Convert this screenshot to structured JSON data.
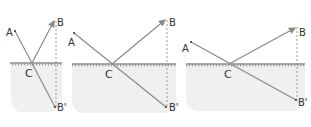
{
  "diagram": {
    "colors": {
      "ray": "#8a8a8a",
      "dashed": "#9a9a9a",
      "surface": "#555555",
      "water": "#f0f0f0",
      "label": "#333333"
    },
    "panels": [
      {
        "id": 1,
        "labels": {
          "A": "A",
          "B": "B",
          "C": "C",
          "Bp": "B'"
        }
      },
      {
        "id": 2,
        "labels": {
          "A": "A",
          "B": "B",
          "C": "C",
          "Bp": "B'"
        }
      },
      {
        "id": 3,
        "labels": {
          "A": "A",
          "B": "B",
          "C": "C",
          "Bp": "B'"
        }
      }
    ]
  }
}
